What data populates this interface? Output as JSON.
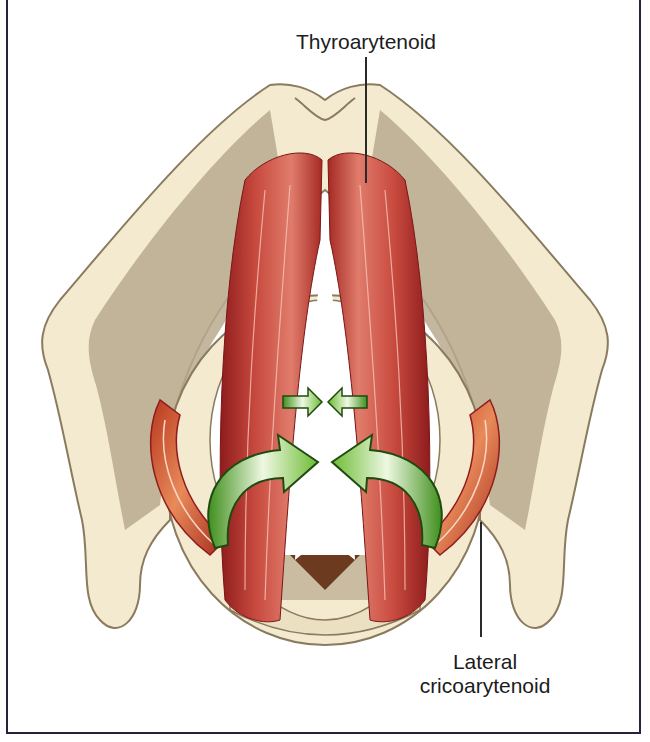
{
  "figure": {
    "labels": {
      "top": "Thyroarytenoid",
      "bottom_line1": "Lateral",
      "bottom_line2": "cricoarytenoid"
    },
    "arrows": {
      "small_pair": "medial-compression-arrows",
      "large_pair": "rotation-arrows"
    },
    "colors": {
      "frame": "#23233f",
      "cartilage_light": "#f3ead0",
      "cartilage_shadow": "#b9aa8e",
      "cartilage_outline": "#8a7a5e",
      "muscle_dark": "#8e1c1c",
      "muscle_mid": "#c0423b",
      "muscle_light": "#e98a77",
      "lateral_muscle": "#d2582e",
      "arrow_green": "#5fae2c",
      "arrow_green_light": "#e6f4d2",
      "arrow_outline": "#1f4a10",
      "text": "#1c1c1c"
    }
  }
}
